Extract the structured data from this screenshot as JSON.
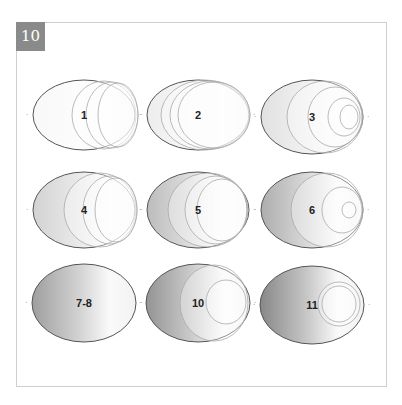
{
  "figure": {
    "number": "10",
    "badge_color": "#8a8a8a",
    "frame_color": "#cfcfcf"
  },
  "panels": [
    {
      "label": "1",
      "cx": 84,
      "cy": 115,
      "rx": 51,
      "ry": 35,
      "shade": 0.05,
      "rings": [
        {
          "cx": 104,
          "cy": 115,
          "rx": 32,
          "ry": 34
        },
        {
          "cx": 112,
          "cy": 115,
          "rx": 26,
          "ry": 33
        },
        {
          "cx": 118,
          "cy": 115,
          "rx": 20,
          "ry": 32
        }
      ]
    },
    {
      "label": "2",
      "cx": 198,
      "cy": 115,
      "rx": 51,
      "ry": 35,
      "shade": 0.12,
      "rings": [
        {
          "cx": 205,
          "cy": 115,
          "rx": 44,
          "ry": 35
        },
        {
          "cx": 210,
          "cy": 115,
          "rx": 40,
          "ry": 34
        },
        {
          "cx": 214,
          "cy": 115,
          "rx": 36,
          "ry": 33
        }
      ]
    },
    {
      "label": "3",
      "cx": 312,
      "cy": 117,
      "rx": 51,
      "ry": 37,
      "shade": 0.2,
      "rings": [
        {
          "cx": 325,
          "cy": 117,
          "rx": 38,
          "ry": 36
        },
        {
          "cx": 335,
          "cy": 117,
          "rx": 27,
          "ry": 30
        },
        {
          "cx": 344,
          "cy": 117,
          "rx": 16,
          "ry": 19
        },
        {
          "cx": 349,
          "cy": 117,
          "rx": 9,
          "ry": 12
        }
      ]
    },
    {
      "label": "4",
      "cx": 84,
      "cy": 210,
      "rx": 51,
      "ry": 38,
      "shade": 0.3,
      "rings": [
        {
          "cx": 100,
          "cy": 210,
          "rx": 36,
          "ry": 37
        },
        {
          "cx": 110,
          "cy": 210,
          "rx": 27,
          "ry": 34
        },
        {
          "cx": 116,
          "cy": 210,
          "rx": 21,
          "ry": 32
        }
      ]
    },
    {
      "label": "5",
      "cx": 198,
      "cy": 210,
      "rx": 51,
      "ry": 38,
      "shade": 0.45,
      "rings": [
        {
          "cx": 208,
          "cy": 210,
          "rx": 40,
          "ry": 37
        },
        {
          "cx": 216,
          "cy": 210,
          "rx": 31,
          "ry": 34
        },
        {
          "cx": 222,
          "cy": 210,
          "rx": 25,
          "ry": 31
        }
      ]
    },
    {
      "label": "6",
      "cx": 312,
      "cy": 210,
      "rx": 51,
      "ry": 38,
      "shade": 0.55,
      "rings": [
        {
          "cx": 327,
          "cy": 210,
          "rx": 36,
          "ry": 37
        },
        {
          "cx": 342,
          "cy": 210,
          "rx": 20,
          "ry": 23
        },
        {
          "cx": 349,
          "cy": 210,
          "rx": 7,
          "ry": 8
        }
      ]
    },
    {
      "label": "7-8",
      "cx": 84,
      "cy": 303,
      "rx": 52,
      "ry": 39,
      "shade": 0.65,
      "rings": []
    },
    {
      "label": "10",
      "cx": 198,
      "cy": 303,
      "rx": 52,
      "ry": 39,
      "shade": 0.72,
      "rings": [
        {
          "cx": 214,
          "cy": 303,
          "rx": 34,
          "ry": 38
        },
        {
          "cx": 226,
          "cy": 302,
          "rx": 20,
          "ry": 22
        }
      ]
    },
    {
      "label": "11",
      "cx": 312,
      "cy": 305,
      "rx": 52,
      "ry": 39,
      "shade": 0.8,
      "rings": [
        {
          "cx": 339,
          "cy": 304,
          "rx": 21,
          "ry": 22
        },
        {
          "cx": 339,
          "cy": 304,
          "rx": 17,
          "ry": 18
        }
      ]
    }
  ]
}
